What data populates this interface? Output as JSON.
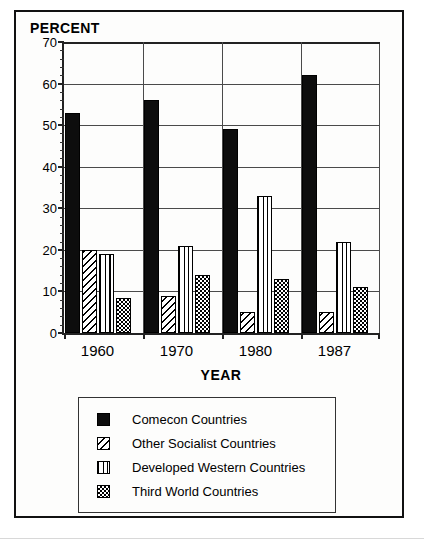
{
  "figure": {
    "y_axis_title": "PERCENT",
    "x_axis_title": "YEAR"
  },
  "legend": {
    "items": [
      {
        "label": "Comecon Countries",
        "pattern": "solid-black-swatch"
      },
      {
        "label": "Other Socialist Countries",
        "pattern": "diagonal-hatch-swatch"
      },
      {
        "label": "Developed Western Countries",
        "pattern": "vertical-stripe-swatch"
      },
      {
        "label": "Third World Countries",
        "pattern": "checkerboard-swatch"
      }
    ]
  },
  "chart_data": {
    "type": "bar",
    "title": "",
    "subtitle": "",
    "xlabel": "YEAR",
    "ylabel": "PERCENT",
    "categories": [
      "1960",
      "1970",
      "1980",
      "1987"
    ],
    "series": [
      {
        "name": "Comecon Countries",
        "values": [
          53,
          56,
          49,
          62
        ]
      },
      {
        "name": "Other Socialist Countries",
        "values": [
          20,
          9,
          5,
          5
        ]
      },
      {
        "name": "Developed Western Countries",
        "values": [
          19,
          21,
          33,
          22
        ]
      },
      {
        "name": "Third World Countries",
        "values": [
          8.5,
          14,
          13,
          11
        ]
      }
    ],
    "ylim": [
      0,
      70
    ],
    "ytick_labels": [
      "0",
      "10",
      "20",
      "30",
      "40",
      "50",
      "60",
      "70"
    ],
    "ytick_values": [
      0,
      10,
      20,
      30,
      40,
      50,
      60,
      70
    ],
    "yminor_interval": 2,
    "grid": true,
    "grid_axis": "y",
    "legend_position": "below-plot",
    "group_separators": true
  }
}
